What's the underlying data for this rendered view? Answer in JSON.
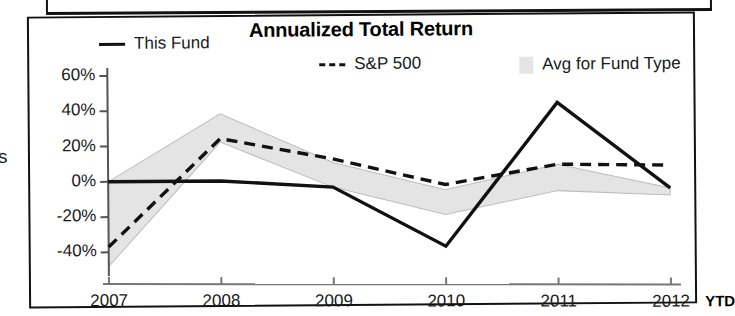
{
  "page": {
    "margin_glyph": "s"
  },
  "chart": {
    "title": "Annualized Total Return",
    "legend": [
      {
        "label": "This Fund",
        "marker": "solid-line-icon",
        "color": "#111111"
      },
      {
        "label": "S&P 500",
        "marker": "dashed-line-icon",
        "color": "#111111"
      },
      {
        "label": "Avg for Fund Type",
        "marker": "gray-band-swatch-icon",
        "color": "#e4e4e4"
      }
    ],
    "axis": {
      "y_ticks": [
        "60%",
        "40%",
        "20%",
        "0%",
        "-20%",
        "-40%"
      ],
      "x_ticks": [
        "2007",
        "2008",
        "2009",
        "2010",
        "2011",
        "2012"
      ],
      "x_suffix": "YTD"
    }
  },
  "chart_data": {
    "type": "line",
    "title": "Annualized Total Return",
    "xlabel": "",
    "ylabel": "",
    "categories": [
      "2007",
      "2008",
      "2009",
      "2010",
      "2011",
      "2012"
    ],
    "x_axis_note": "2012 is YTD",
    "ylim": [
      -50,
      60
    ],
    "y_ticks": [
      60,
      40,
      20,
      0,
      -20,
      -40
    ],
    "y_tick_labels": [
      "60%",
      "40%",
      "20%",
      "0%",
      "-20%",
      "-40%"
    ],
    "grid": false,
    "legend_position": "top",
    "series": [
      {
        "name": "This Fund",
        "style": "solid",
        "color": "#111111",
        "values": [
          0,
          0,
          -4,
          -38,
          43,
          -6
        ]
      },
      {
        "name": "S&P 500",
        "style": "dashed",
        "color": "#111111",
        "values": [
          -37,
          24,
          12,
          -3,
          8,
          7
        ]
      },
      {
        "name": "Avg for Fund Type",
        "style": "band",
        "color": "#e4e4e4",
        "band_upper": [
          0,
          38,
          10,
          -6,
          8,
          -6
        ],
        "band_lower": [
          -48,
          22,
          -4,
          -20,
          -7,
          -10
        ]
      }
    ]
  }
}
